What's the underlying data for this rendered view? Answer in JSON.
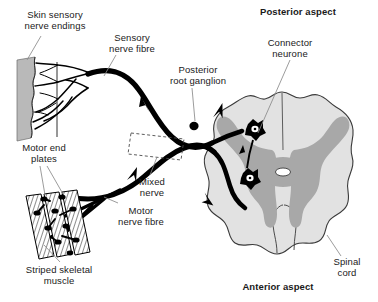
{
  "figure": {
    "type": "anatomical-diagram",
    "background_color": "#ffffff",
    "ink_color": "#000000"
  },
  "labels": {
    "skin_sensory_nerve_endings": "Skin sensory\nnerve endings",
    "sensory_nerve_fibre": "Sensory\nnerve fibre",
    "posterior_root_ganglion": "Posterior\nroot ganglion",
    "posterior_aspect": "Posterior aspect",
    "connector_neurone": "Connector\nneurone",
    "motor_end_plates": "Motor end\nplates",
    "mixed_nerve": "Mixed\nnerve",
    "motor_nerve_fibre": "Motor\nnerve fibre",
    "striped_skeletal_muscle": "Striped skeletal\nmuscle",
    "spinal_cord": "Spinal\ncord",
    "anterior_aspect": "Anterior aspect"
  },
  "colors": {
    "skin_fill": "#b9b9b9",
    "white_matter": "#e2e2e2",
    "grey_matter": "#a8a8a8",
    "cord_outline": "#3a3a3a",
    "nerve": "#000000",
    "leader": "#8a8a8a",
    "central_canal": "#ffffff"
  },
  "structures": {
    "skin_band": "grey vertical band with wavy medial border",
    "nerve_endings": "branching dendritic terminals in skin",
    "ganglion": "small filled black oval on dorsal root",
    "mixed_nerve_marker": "dashed rectangle enclosing both fibres",
    "muscle_bundles": "three striped skeletal muscle fascicles",
    "end_plates": "black terminal boutons on muscle fibres",
    "cord_grey_matter": "butterfly shaped grey matter",
    "central_canal": "small white oval at centre of cord",
    "neurone_bodies": "two star shaped cell bodies in grey matter"
  },
  "flow_arrows": {
    "count": 5,
    "meaning": "direction of nerve impulse conduction"
  }
}
